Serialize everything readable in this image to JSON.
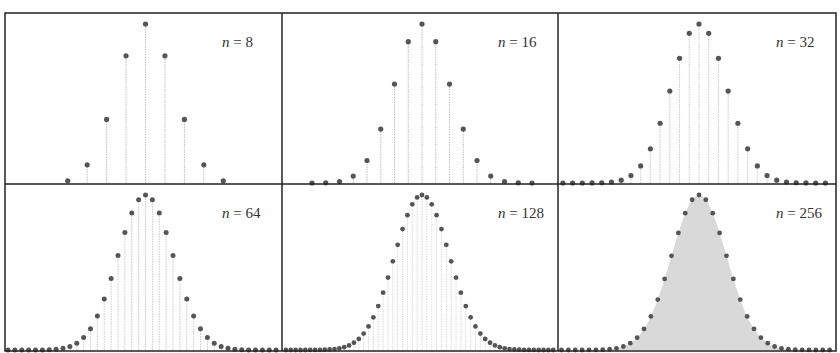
{
  "chart_data": {
    "type": "stem",
    "title": "",
    "layout": {
      "rows": 2,
      "cols": 3,
      "grid": false,
      "legend": "none"
    },
    "xlabel": "",
    "ylabel": "",
    "p": 0.5,
    "colors": {
      "dot": "#555555",
      "stem": "#bdbdbd",
      "frame": "#222222",
      "fill_256": "#d9d9d9"
    },
    "panels": [
      {
        "label_var": "n",
        "label_eq": " = ",
        "n": 8,
        "label": "n = 8"
      },
      {
        "label_var": "n",
        "label_eq": " = ",
        "n": 16,
        "label": "n = 16"
      },
      {
        "label_var": "n",
        "label_eq": " = ",
        "n": 32,
        "label": "n = 32"
      },
      {
        "label_var": "n",
        "label_eq": " = ",
        "n": 64,
        "label": "n = 64"
      },
      {
        "label_var": "n",
        "label_eq": " = ",
        "n": 128,
        "label": "n = 128"
      },
      {
        "label_var": "n",
        "label_eq": " = ",
        "n": 256,
        "label": "n = 256"
      }
    ],
    "series": [
      {
        "name": "n = 8",
        "x": [
          0,
          1,
          2,
          3,
          4,
          5,
          6,
          7,
          8
        ],
        "values": [
          0.0039,
          0.0313,
          0.1094,
          0.2188,
          0.2734,
          0.2188,
          0.1094,
          0.0313,
          0.0039
        ]
      },
      {
        "name": "n = 16",
        "x_center": 8,
        "peak": 0.1964
      },
      {
        "name": "n = 32",
        "x_center": 16,
        "peak": 0.14
      },
      {
        "name": "n = 64",
        "x_center": 32,
        "peak": 0.0993
      },
      {
        "name": "n = 128",
        "x_center": 64,
        "peak": 0.0703
      },
      {
        "name": "n = 256",
        "x_center": 128,
        "peak": 0.0498
      }
    ]
  }
}
